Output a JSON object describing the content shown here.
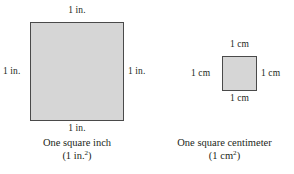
{
  "figure": {
    "background_color": "#ffffff",
    "square_fill_color": "#d6d6d6",
    "square_border_color": "#4a4a4a",
    "text_color": "#231f20"
  },
  "square_inch": {
    "name": "one-square-inch",
    "labels": {
      "top": "1 in.",
      "bottom": "1 in.",
      "left": "1 in.",
      "right": "1 in."
    },
    "caption": {
      "line1": "One square inch",
      "line2_prefix": "(1 in.",
      "line2_exponent": "2",
      "line2_suffix": ")"
    }
  },
  "square_centimeter": {
    "name": "one-square-centimeter",
    "labels": {
      "top": "1 cm",
      "bottom": "1 cm",
      "left": "1 cm",
      "right": "1 cm"
    },
    "caption": {
      "line1": "One square centimeter",
      "line2_prefix": "(1 cm",
      "line2_exponent": "2",
      "line2_suffix": ")"
    }
  }
}
